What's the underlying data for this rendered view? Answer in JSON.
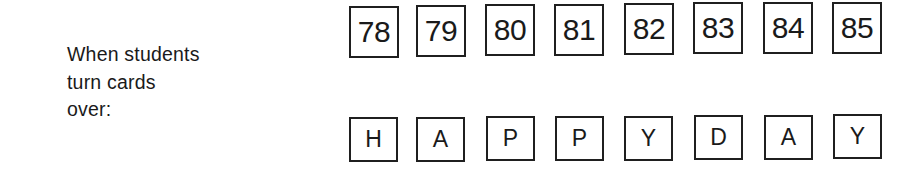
{
  "label": {
    "lines": [
      "When students",
      "turn cards",
      "over:"
    ]
  },
  "cards": {
    "front": [
      "78",
      "79",
      "80",
      "81",
      "82",
      "83",
      "84",
      "85"
    ],
    "back": [
      "H",
      "A",
      "P",
      "P",
      "Y",
      "D",
      "A",
      "Y"
    ]
  }
}
